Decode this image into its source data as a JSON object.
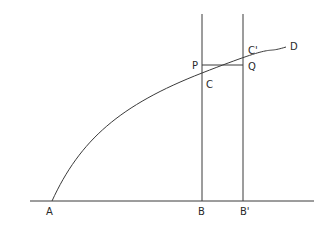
{
  "diagram": {
    "type": "geometric-construction",
    "labels": {
      "A": "A",
      "B": "B",
      "B_prime": "B'",
      "C": "C",
      "C_prime": "C'",
      "P": "P",
      "Q": "Q",
      "D": "D"
    },
    "colors": {
      "line": "#3a3a3a",
      "text": "#2a2a2a",
      "background": "#ffffff"
    }
  }
}
